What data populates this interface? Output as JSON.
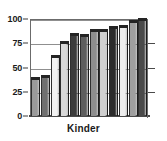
{
  "chart_data": {
    "type": "bar",
    "title": "",
    "subtitle": "",
    "xlabel": "Kinder",
    "ylabel": "",
    "ylim": [
      0,
      100
    ],
    "yticks": [
      0,
      25,
      50,
      75,
      100
    ],
    "ytick_labels": [
      "0",
      "25",
      "50",
      "75",
      "100"
    ],
    "grid": true,
    "grid_axis": "y",
    "legend": false,
    "legend_position": "none",
    "categories": [
      "1",
      "2",
      "3",
      "4",
      "5",
      "6",
      "7",
      "8",
      "9",
      "10",
      "11",
      "12"
    ],
    "values": [
      38,
      40,
      61,
      75,
      84,
      82,
      88,
      88,
      91,
      92,
      97,
      99
    ],
    "bar_colors": [
      "#9a9a9a",
      "#707070",
      "#f2f2f2",
      "#d8d8d8",
      "#3c3c3c",
      "#5e5e5e",
      "#8e8e8e",
      "#cfcfcf",
      "#2b2b2b",
      "#ededed",
      "#9f9f9f",
      "#4a4a4a"
    ],
    "bar_top_color": "#242424",
    "axis_color": "#4a4a4a",
    "gridline_color": "#8f8f8f",
    "background_color": "#ffffff",
    "text_color": "#1a1a1a",
    "style": "3d-shaded-grayscale"
  }
}
